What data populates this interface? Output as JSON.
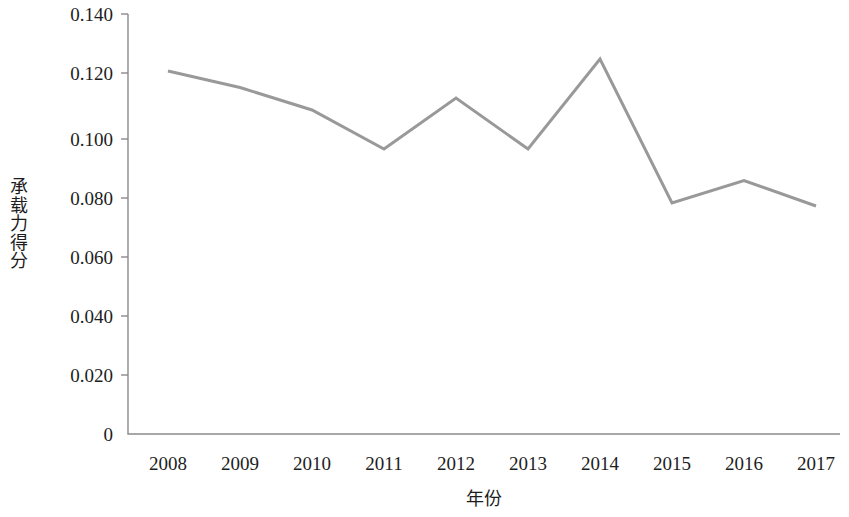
{
  "chart_data": {
    "type": "line",
    "title": "",
    "xlabel": "年份",
    "ylabel": "承载力得分",
    "categories": [
      "2008",
      "2009",
      "2010",
      "2011",
      "2012",
      "2013",
      "2014",
      "2015",
      "2016",
      "2017"
    ],
    "values": [
      0.121,
      0.1155,
      0.108,
      0.095,
      0.112,
      0.095,
      0.125,
      0.077,
      0.0845,
      0.076
    ],
    "series": [
      {
        "name": "承载力得分",
        "values": [
          0.121,
          0.1155,
          0.108,
          0.095,
          0.112,
          0.095,
          0.125,
          0.077,
          0.0845,
          0.076
        ]
      }
    ],
    "ylim": [
      0,
      0.14
    ],
    "ytick_labels": [
      "0.140",
      "0.120",
      "0.100",
      "0.080",
      "0.060",
      "0.040",
      "0.020",
      "0"
    ],
    "ytick_values": [
      0.14,
      0.12,
      0.1,
      0.08,
      0.06,
      0.04,
      0.02,
      0
    ],
    "grid": false,
    "legend": "none",
    "line_color": "#999999",
    "line_width": 3,
    "axis_color": "#8a8a8a",
    "background_color": "#ffffff"
  },
  "axis": {
    "y_title_chars": [
      "承",
      "载",
      "力",
      "得",
      "分"
    ],
    "x_title": "年份"
  }
}
